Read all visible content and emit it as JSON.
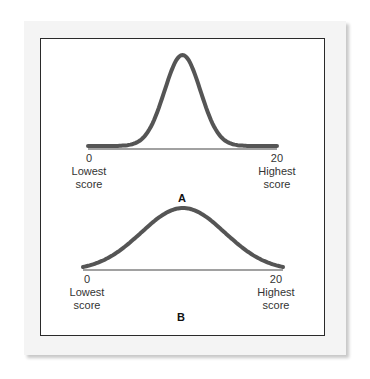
{
  "chart_data": [
    {
      "type": "line",
      "title": "A",
      "description": "Narrow, tall bell-shaped distribution (low variability)",
      "x_range": [
        0,
        20
      ],
      "x_ticks": [
        "0",
        "20"
      ],
      "x_tick_captions": [
        "Lowest score",
        "Highest score"
      ],
      "curve": {
        "mean": 10,
        "sd": 1.9,
        "shape": "normal"
      },
      "grid": false,
      "legend": null
    },
    {
      "type": "line",
      "title": "B",
      "description": "Wide, flat bell-shaped distribution (high variability)",
      "x_range": [
        0,
        20
      ],
      "x_ticks": [
        "0",
        "20"
      ],
      "x_tick_captions": [
        "Lowest score",
        "Highest score"
      ],
      "curve": {
        "mean": 10,
        "sd": 4.2,
        "shape": "normal"
      },
      "grid": false,
      "legend": null
    }
  ],
  "panels": {
    "a": {
      "label": "A",
      "left_value": "0",
      "left_caption_1": "Lowest",
      "left_caption_2": "score",
      "right_value": "20",
      "right_caption_1": "Highest",
      "right_caption_2": "score"
    },
    "b": {
      "label": "B",
      "left_value": "0",
      "left_caption_1": "Lowest",
      "left_caption_2": "score",
      "right_value": "20",
      "right_caption_1": "Highest",
      "right_caption_2": "score"
    }
  },
  "colors": {
    "curve": "#555555",
    "axis": "#444444",
    "frame": "#2a2a2a",
    "card": "#f4f4f4"
  }
}
